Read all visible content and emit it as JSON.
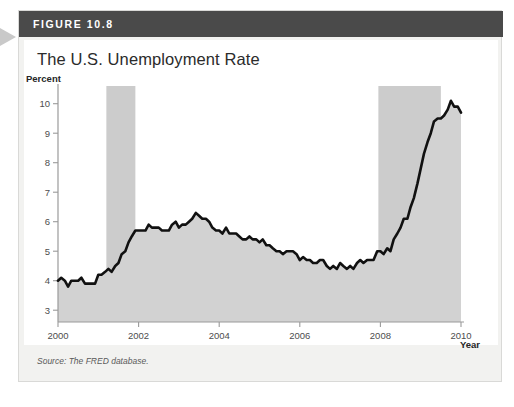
{
  "figure": {
    "number_label": "FIGURE 10.8",
    "title": "The U.S. Unemployment Rate",
    "source_text": "Source: The FRED database."
  },
  "colors": {
    "header_bar": "#4a4a4a",
    "figure_bg": "#f2f2f0",
    "panel_bg": "#ffffff",
    "line": "#111111",
    "area_fill": "#d2d2d2",
    "recession_band": "#cccccc",
    "axis": "#9a9a9a",
    "edge_arrow": "#c9c9c9"
  },
  "chart_data": {
    "type": "line",
    "title": "The U.S. Unemployment Rate",
    "xlabel": "Year",
    "ylabel": "Percent",
    "xlim": [
      2000,
      2010.0
    ],
    "ylim": [
      2.6,
      10.6
    ],
    "yticks": [
      3,
      4,
      5,
      6,
      7,
      8,
      9,
      10
    ],
    "ytick_labels": [
      "3",
      "4",
      "5",
      "6",
      "7",
      "8",
      "9",
      "10"
    ],
    "xticks": [
      2000,
      2002,
      2004,
      2006,
      2008,
      2010
    ],
    "xtick_labels": [
      "2000",
      "2002",
      "2004",
      "2006",
      "2008",
      "2010"
    ],
    "grid": false,
    "legend": null,
    "area_filled_below_line": true,
    "annotations": [
      {
        "kind": "recession-band",
        "label": "2001 recession",
        "x_start": 2001.2,
        "x_end": 2001.92
      },
      {
        "kind": "recession-band",
        "label": "2007-2009 recession",
        "x_start": 2007.95,
        "x_end": 2009.5
      }
    ],
    "series": [
      {
        "name": "Unemployment rate",
        "x": [
          2000.0,
          2000.08,
          2000.17,
          2000.25,
          2000.33,
          2000.42,
          2000.5,
          2000.58,
          2000.67,
          2000.75,
          2000.83,
          2000.92,
          2001.0,
          2001.08,
          2001.17,
          2001.25,
          2001.33,
          2001.42,
          2001.5,
          2001.58,
          2001.67,
          2001.75,
          2001.83,
          2001.92,
          2002.0,
          2002.08,
          2002.17,
          2002.25,
          2002.33,
          2002.42,
          2002.5,
          2002.58,
          2002.67,
          2002.75,
          2002.83,
          2002.92,
          2003.0,
          2003.08,
          2003.17,
          2003.25,
          2003.33,
          2003.42,
          2003.5,
          2003.58,
          2003.67,
          2003.75,
          2003.83,
          2003.92,
          2004.0,
          2004.08,
          2004.17,
          2004.25,
          2004.33,
          2004.42,
          2004.5,
          2004.58,
          2004.67,
          2004.75,
          2004.83,
          2004.92,
          2005.0,
          2005.08,
          2005.17,
          2005.25,
          2005.33,
          2005.42,
          2005.5,
          2005.58,
          2005.67,
          2005.75,
          2005.83,
          2005.92,
          2006.0,
          2006.08,
          2006.17,
          2006.25,
          2006.33,
          2006.42,
          2006.5,
          2006.58,
          2006.67,
          2006.75,
          2006.83,
          2006.92,
          2007.0,
          2007.08,
          2007.17,
          2007.25,
          2007.33,
          2007.42,
          2007.5,
          2007.58,
          2007.67,
          2007.75,
          2007.83,
          2007.92,
          2008.0,
          2008.08,
          2008.17,
          2008.25,
          2008.33,
          2008.42,
          2008.5,
          2008.58,
          2008.67,
          2008.75,
          2008.83,
          2008.92,
          2009.0,
          2009.08,
          2009.17,
          2009.25,
          2009.33,
          2009.42,
          2009.5,
          2009.58,
          2009.67,
          2009.75,
          2009.83,
          2009.92,
          2010.0
        ],
        "values": [
          4.0,
          4.1,
          4.0,
          3.8,
          4.0,
          4.0,
          4.0,
          4.1,
          3.9,
          3.9,
          3.9,
          3.9,
          4.2,
          4.2,
          4.3,
          4.4,
          4.3,
          4.5,
          4.6,
          4.9,
          5.0,
          5.3,
          5.5,
          5.7,
          5.7,
          5.7,
          5.7,
          5.9,
          5.8,
          5.8,
          5.8,
          5.7,
          5.7,
          5.7,
          5.9,
          6.0,
          5.8,
          5.9,
          5.9,
          6.0,
          6.1,
          6.3,
          6.2,
          6.1,
          6.1,
          6.0,
          5.8,
          5.7,
          5.7,
          5.6,
          5.8,
          5.6,
          5.6,
          5.6,
          5.5,
          5.4,
          5.4,
          5.5,
          5.4,
          5.4,
          5.3,
          5.4,
          5.2,
          5.2,
          5.1,
          5.0,
          5.0,
          4.9,
          5.0,
          5.0,
          5.0,
          4.9,
          4.7,
          4.8,
          4.7,
          4.7,
          4.6,
          4.6,
          4.7,
          4.7,
          4.5,
          4.4,
          4.5,
          4.4,
          4.6,
          4.5,
          4.4,
          4.5,
          4.4,
          4.6,
          4.7,
          4.6,
          4.7,
          4.7,
          4.7,
          5.0,
          5.0,
          4.9,
          5.1,
          5.0,
          5.4,
          5.6,
          5.8,
          6.1,
          6.1,
          6.5,
          6.8,
          7.3,
          7.8,
          8.3,
          8.7,
          9.0,
          9.4,
          9.5,
          9.5,
          9.6,
          9.8,
          10.1,
          9.9,
          9.9,
          9.7
        ]
      }
    ]
  }
}
